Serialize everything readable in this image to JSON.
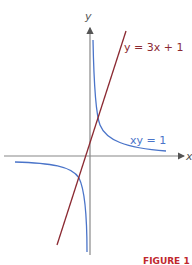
{
  "figure": {
    "axis_labels": {
      "x": "x",
      "y": "y"
    },
    "curves": [
      {
        "name": "hyperbola",
        "label": "xy = 1",
        "color": "#4a74c9"
      },
      {
        "name": "line",
        "label": "y = 3x + 1",
        "color": "#8b2a32"
      }
    ],
    "footer_fragment": "FIGURE 1",
    "colors": {
      "axis": "#888888",
      "footer": "#c0282d"
    }
  }
}
